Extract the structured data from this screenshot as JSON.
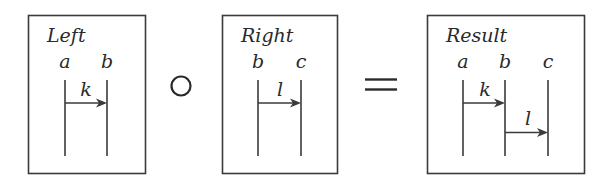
{
  "diagram": {
    "type": "composition-of-sequence-diagrams",
    "colors": {
      "stroke": "#3a3a3a",
      "text": "#2a2a2a",
      "background": "#ffffff"
    },
    "operators": {
      "compose": {
        "symbol": "∘",
        "name": "composition"
      },
      "equals": {
        "symbol": "=",
        "name": "equals"
      }
    },
    "boxes": [
      {
        "id": "left",
        "title": "Left",
        "lifelines": [
          {
            "name": "a"
          },
          {
            "name": "b"
          }
        ],
        "messages": [
          {
            "label": "k",
            "from": "a",
            "to": "b"
          }
        ]
      },
      {
        "id": "right",
        "title": "Right",
        "lifelines": [
          {
            "name": "b"
          },
          {
            "name": "c"
          }
        ],
        "messages": [
          {
            "label": "l",
            "from": "b",
            "to": "c"
          }
        ]
      },
      {
        "id": "result",
        "title": "Result",
        "lifelines": [
          {
            "name": "a"
          },
          {
            "name": "b"
          },
          {
            "name": "c"
          }
        ],
        "messages": [
          {
            "label": "k",
            "from": "a",
            "to": "b"
          },
          {
            "label": "l",
            "from": "b",
            "to": "c"
          }
        ]
      }
    ]
  }
}
